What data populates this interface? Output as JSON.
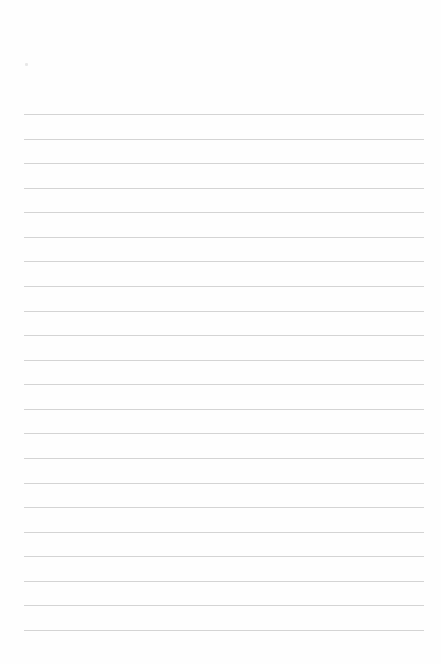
{
  "document": {
    "type": "lined-paper",
    "line_count": 22,
    "first_line_y": 114,
    "line_spacing": 24.57,
    "line_left": 24,
    "line_width": 400,
    "line_color": "#d4d4d4",
    "background_color": "#fefefe"
  }
}
